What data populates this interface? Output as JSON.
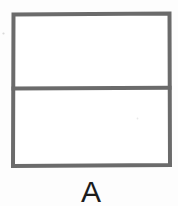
{
  "figure": {
    "kind": "divided-rectangle-diagram",
    "label": "A",
    "background_color": "#fdfdfd",
    "stroke_color": "#6b6b6b",
    "fill_color": "#ffffff",
    "label_color": "#1c1c1c",
    "stroke_width": 4,
    "parts_total": 2,
    "parts_shaded": 0,
    "fraction_shaded": "0/2",
    "rectangle": {
      "x": 13,
      "y": 14,
      "width": 157,
      "height": 152
    },
    "divider": {
      "orientation": "horizontal",
      "y": 88,
      "x_start": 13,
      "x_end": 170
    },
    "regions": [
      {
        "name": "top-half",
        "shaded": false
      },
      {
        "name": "bottom-half",
        "shaded": false
      }
    ],
    "specks": [
      {
        "x": 3,
        "y": 33
      },
      {
        "x": 137,
        "y": 118
      }
    ]
  }
}
